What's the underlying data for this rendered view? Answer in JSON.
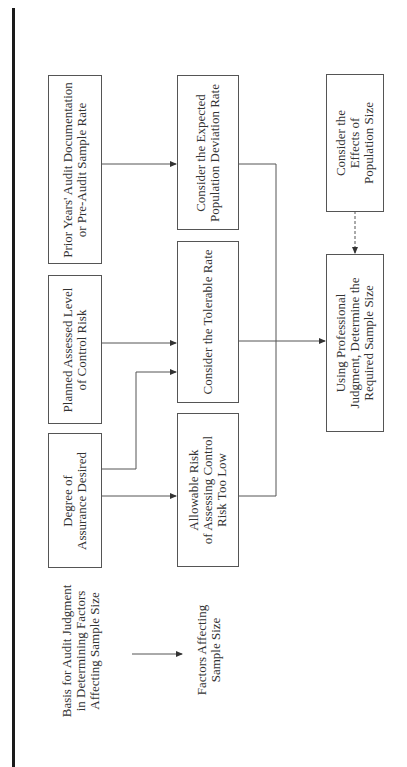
{
  "diagram": {
    "orientation": "rotated-90-ccw",
    "legend": {
      "basis_lines": [
        "Basis for Audit Judgment",
        "in Determining Factors",
        "Affecting Sample Size"
      ],
      "factors_lines": [
        "Factors Affecting",
        "Sample Size"
      ]
    },
    "column_basis": [
      {
        "id": "prior-years",
        "lines": [
          "Prior Years' Audit Documentation",
          "or Pre-Audit Sample Rate"
        ]
      },
      {
        "id": "planned-control-risk",
        "lines": [
          "Planned Assessed Level",
          "of Control Risk"
        ]
      },
      {
        "id": "degree-assurance",
        "lines": [
          "Degree of",
          "Assurance Desired"
        ]
      }
    ],
    "column_factors": [
      {
        "id": "expected-deviation",
        "lines": [
          "Consider the Expected",
          "Population Deviation Rate"
        ]
      },
      {
        "id": "tolerable-rate",
        "lines": [
          "Consider the Tolerable Rate"
        ]
      },
      {
        "id": "allowable-risk",
        "lines": [
          "Allowable Risk",
          "of Assessing Control",
          "Risk Too Low"
        ]
      }
    ],
    "column_result": [
      {
        "id": "population-size",
        "lines": [
          "Consider the",
          "Effects of",
          "Population Size"
        ]
      },
      {
        "id": "sample-size",
        "lines": [
          "Using Professional",
          "Judgment, Determine the",
          "Required Sample Size"
        ]
      }
    ],
    "edges": [
      {
        "from": "prior-years",
        "to": "expected-deviation",
        "style": "solid"
      },
      {
        "from": "planned-control-risk",
        "to": "tolerable-rate",
        "style": "solid"
      },
      {
        "from": "degree-assurance",
        "to": "tolerable-rate",
        "style": "solid"
      },
      {
        "from": "degree-assurance",
        "to": "allowable-risk",
        "style": "solid"
      },
      {
        "from": "expected-deviation",
        "to": "sample-size",
        "style": "solid"
      },
      {
        "from": "tolerable-rate",
        "to": "sample-size",
        "style": "solid"
      },
      {
        "from": "allowable-risk",
        "to": "sample-size",
        "style": "solid"
      },
      {
        "from": "population-size",
        "to": "sample-size",
        "style": "dashed"
      }
    ],
    "colors": {
      "line": "#555555",
      "border": "#1a1a1a",
      "text": "#333333"
    }
  }
}
